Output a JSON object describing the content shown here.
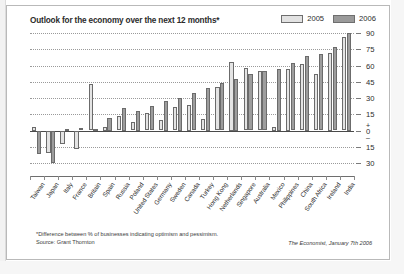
{
  "chart_data": {
    "type": "bar",
    "title": "Outlook for the economy over the next 12 months*",
    "xlabel": "",
    "ylabel": "",
    "ylim": [
      -30,
      90
    ],
    "yticks": [
      90,
      75,
      60,
      45,
      30,
      15,
      0,
      -15,
      -30
    ],
    "ytick_labels": [
      "90",
      "75",
      "60",
      "45",
      "30",
      "15",
      "0",
      "15",
      "30"
    ],
    "grid": true,
    "legend_position": "top-right",
    "categories": [
      "Taiwan",
      "Japan",
      "Italy",
      "France",
      "Britain",
      "Spain",
      "Russia",
      "Poland",
      "United States",
      "Germany",
      "Sweden",
      "Canada",
      "Turkey",
      "Hong Kong",
      "Netherlands",
      "Singapore",
      "Australia",
      "Mexico",
      "Philippines",
      "China",
      "South Africa",
      "Ireland",
      "India"
    ],
    "series": [
      {
        "name": "2005",
        "color": "#e4e4e4",
        "values": [
          3,
          -21,
          -12,
          -17,
          43,
          3,
          13,
          8,
          16,
          10,
          22,
          24,
          11,
          40,
          63,
          58,
          55,
          3,
          57,
          61,
          52,
          72,
          86
        ]
      },
      {
        "name": "2006",
        "color": "#9d9d9d",
        "values": [
          -22,
          -30,
          1,
          2,
          1,
          12,
          21,
          18,
          23,
          27,
          30,
          35,
          39,
          44,
          48,
          52,
          55,
          57,
          62,
          69,
          71,
          77,
          90
        ]
      }
    ],
    "footnote": "*Difference between % of businesses indicating optimism and pessimism.",
    "source": "Source: Grant Thornton",
    "credit": "The Economist, January 7th 2006"
  }
}
